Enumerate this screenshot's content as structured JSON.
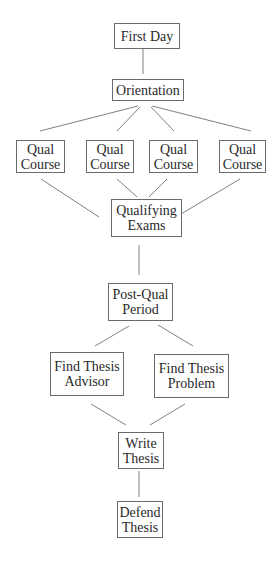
{
  "diagram": {
    "type": "flowchart",
    "colors": {
      "line": "#808080",
      "box_border": "#6a6a6a",
      "text": "#2a2a2a",
      "background": "#ffffff"
    },
    "nodes": [
      {
        "id": "first-day",
        "label": "First Day"
      },
      {
        "id": "orientation",
        "label": "Orientation"
      },
      {
        "id": "qual-course-1",
        "label": "Qual\nCourse"
      },
      {
        "id": "qual-course-2",
        "label": "Qual\nCourse"
      },
      {
        "id": "qual-course-3",
        "label": "Qual\nCourse"
      },
      {
        "id": "qual-course-4",
        "label": "Qual\nCourse"
      },
      {
        "id": "qualifying-exams",
        "label": "Qualifying\nExams"
      },
      {
        "id": "post-qual-period",
        "label": "Post-Qual\nPeriod"
      },
      {
        "id": "find-thesis-advisor",
        "label": "Find Thesis\nAdvisor"
      },
      {
        "id": "find-thesis-problem",
        "label": "Find Thesis\nProblem"
      },
      {
        "id": "write-thesis",
        "label": "Write\nThesis"
      },
      {
        "id": "defend-thesis",
        "label": "Defend\nThesis"
      }
    ],
    "edges": [
      [
        "first-day",
        "orientation"
      ],
      [
        "orientation",
        "qual-course-1"
      ],
      [
        "orientation",
        "qual-course-2"
      ],
      [
        "orientation",
        "qual-course-3"
      ],
      [
        "orientation",
        "qual-course-4"
      ],
      [
        "qual-course-1",
        "qualifying-exams"
      ],
      [
        "qual-course-2",
        "qualifying-exams"
      ],
      [
        "qual-course-3",
        "qualifying-exams"
      ],
      [
        "qual-course-4",
        "qualifying-exams"
      ],
      [
        "qualifying-exams",
        "post-qual-period"
      ],
      [
        "post-qual-period",
        "find-thesis-advisor"
      ],
      [
        "post-qual-period",
        "find-thesis-problem"
      ],
      [
        "find-thesis-advisor",
        "write-thesis"
      ],
      [
        "find-thesis-problem",
        "write-thesis"
      ],
      [
        "write-thesis",
        "defend-thesis"
      ]
    ]
  }
}
